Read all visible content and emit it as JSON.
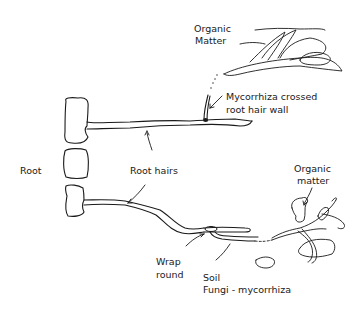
{
  "diagram": {
    "labels": {
      "organic_matter_top_line1": "Organic",
      "organic_matter_top_line2": "Matter",
      "mycorrhiza_crossed_line1": "Mycorrhiza crossed",
      "mycorrhiza_crossed_line2": "root hair wall",
      "root": "Root",
      "root_hairs": "Root hairs",
      "organic_matter_bottom_line1": "Organic",
      "organic_matter_bottom_line2": "matter",
      "wrap_round_line1": "Wrap",
      "wrap_round_line2": "round",
      "soil_line1": "Soil",
      "soil_line2": "Fungi - mycorrhiza"
    },
    "colors": {
      "ink": "#1a1a1a",
      "background": "#ffffff"
    }
  }
}
